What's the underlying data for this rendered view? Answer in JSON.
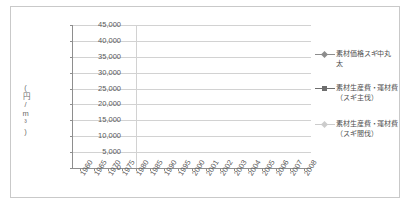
{
  "chart_data": {
    "type": "line",
    "title": "",
    "xlabel": "",
    "ylabel": "(円／m3)",
    "ylabel_display": "(円/m³)",
    "ylim": [
      0,
      45000
    ],
    "ytick_step": 5000,
    "ytick_labels": [
      "45,000",
      "40,000",
      "35,000",
      "30,000",
      "25,000",
      "20,000",
      "15,000",
      "10,000",
      "5,000",
      "0"
    ],
    "grid": true,
    "legend_position": "right",
    "categories": [
      "1960",
      "1965",
      "1970",
      "1975",
      "1980",
      "1985",
      "1990",
      "1995",
      "2000",
      "2001",
      "2002",
      "2003",
      "2004",
      "2005",
      "2006",
      "2007",
      "2008"
    ],
    "series": [
      {
        "name": "素材価格スギ中丸太",
        "marker": "diamond",
        "color": "#8d8d8d",
        "values": [
          11800,
          14600,
          19400,
          31900,
          39800,
          25300,
          26600,
          21600,
          16900,
          15600,
          14100,
          14100,
          13600,
          12900,
          12300,
          12800,
          11500
        ]
      },
      {
        "name": "素材生産費・運材費（スギ主伐）",
        "marker": "square",
        "color": "#6e6e6e",
        "values": [
          null,
          null,
          null,
          9000,
          10700,
          10700,
          11200,
          10800,
          10500,
          9800,
          9400,
          8900,
          8600,
          8400,
          7400,
          7400,
          7300
        ]
      },
      {
        "name": "素材生産費・運材費（スギ間伐）",
        "marker": "diamond",
        "color": "#cccccc",
        "values": [
          null,
          null,
          null,
          null,
          null,
          null,
          null,
          null,
          11100,
          11400,
          11100,
          11600,
          11000,
          11100,
          11600,
          11800,
          11000
        ]
      }
    ]
  },
  "legend": {
    "entries": [
      {
        "label": "素材価格スギ中丸\n太",
        "line1": "素材価格スギ中丸",
        "line2": "太"
      },
      {
        "label": "素材生産費・運材費\n（スギ主伐）",
        "line1": "素材生産費・運材費",
        "line2": "（スギ主伐）"
      },
      {
        "label": "素材生産費・運材費\n（スギ間伐）",
        "line1": "素材生産費・運材費",
        "line2": "（スギ間伐）"
      }
    ]
  }
}
